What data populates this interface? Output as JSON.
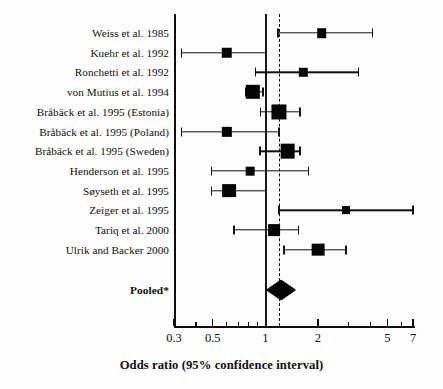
{
  "chart_data": {
    "type": "forest",
    "title": "",
    "xlabel": "Odds ratio (95% confidence interval)",
    "ylabel": "",
    "xscale": "log",
    "xlim": [
      0.3,
      7
    ],
    "grid": false,
    "legend": null,
    "reference_lines": [
      {
        "name": "null-line",
        "value": 1,
        "style": "solid"
      },
      {
        "name": "pooled-line",
        "value": 1.2,
        "style": "dashed"
      }
    ],
    "xticks": [
      {
        "value": 0.3,
        "label": "0.3",
        "major": true
      },
      {
        "value": 0.4,
        "label": "",
        "major": false
      },
      {
        "value": 0.5,
        "label": "0.5",
        "major": true
      },
      {
        "value": 0.6,
        "label": "",
        "major": false
      },
      {
        "value": 0.7,
        "label": "",
        "major": false
      },
      {
        "value": 0.8,
        "label": "",
        "major": false
      },
      {
        "value": 0.9,
        "label": "",
        "major": false
      },
      {
        "value": 1,
        "label": "1",
        "major": true
      },
      {
        "value": 2,
        "label": "2",
        "major": true
      },
      {
        "value": 3,
        "label": "",
        "major": false
      },
      {
        "value": 4,
        "label": "",
        "major": false
      },
      {
        "value": 5,
        "label": "5",
        "major": true
      },
      {
        "value": 6,
        "label": "",
        "major": false
      },
      {
        "value": 7,
        "label": "7",
        "major": true
      }
    ],
    "studies": [
      {
        "label": "Weiss et al. 1985",
        "or": 2.1,
        "ci_low": 1.18,
        "ci_high": 4.1,
        "weight": 0.42,
        "low_clipped": false,
        "high_clipped": false
      },
      {
        "label": "Kuehr et al. 1992",
        "or": 0.6,
        "ci_low": 0.33,
        "ci_high": 1.0,
        "weight": 0.5,
        "low_clipped": false,
        "high_clipped": false
      },
      {
        "label": "Ronchetti et al. 1992",
        "or": 1.65,
        "ci_low": 0.88,
        "ci_high": 3.4,
        "weight": 0.31,
        "low_clipped": false,
        "high_clipped": false
      },
      {
        "label": "von Mutius et al. 1994",
        "or": 0.85,
        "ci_low": 0.77,
        "ci_high": 0.97,
        "weight": 0.85,
        "low_clipped": false,
        "high_clipped": false
      },
      {
        "label": "Bråbäck et al. 1995 (Estonia)",
        "or": 1.2,
        "ci_low": 0.94,
        "ci_high": 1.58,
        "weight": 0.92,
        "low_clipped": false,
        "high_clipped": false
      },
      {
        "label": "Bråbäck et al. 1995 (Poland)",
        "or": 0.6,
        "ci_low": 0.33,
        "ci_high": 1.2,
        "weight": 0.48,
        "low_clipped": false,
        "high_clipped": false
      },
      {
        "label": "Bråbäck et al. 1995 (Sweden)",
        "or": 1.34,
        "ci_low": 0.93,
        "ci_high": 1.58,
        "weight": 0.88,
        "low_clipped": false,
        "high_clipped": false
      },
      {
        "label": "Henderson et al. 1995",
        "or": 0.82,
        "ci_low": 0.49,
        "ci_high": 1.77,
        "weight": 0.33,
        "low_clipped": false,
        "high_clipped": false
      },
      {
        "label": "Søyseth et al. 1995",
        "or": 0.62,
        "ci_low": 0.49,
        "ci_high": 1.0,
        "weight": 0.8,
        "low_clipped": false,
        "high_clipped": false
      },
      {
        "label": "Zeiger et al. 1995",
        "or": 2.9,
        "ci_low": 1.2,
        "ci_high": 7.0,
        "weight": 0.26,
        "low_clipped": false,
        "high_clipped": true
      },
      {
        "label": "Tariq et al. 2000",
        "or": 1.12,
        "ci_low": 0.66,
        "ci_high": 1.55,
        "weight": 0.62,
        "low_clipped": false,
        "high_clipped": false
      },
      {
        "label": "Ulrik and Backer 2000",
        "or": 2.0,
        "ci_low": 1.28,
        "ci_high": 2.9,
        "weight": 0.7,
        "low_clipped": false,
        "high_clipped": false
      }
    ],
    "pooled": {
      "label": "Pooled*",
      "or": 1.22,
      "ci_low": 1.0,
      "ci_high": 1.5
    }
  }
}
